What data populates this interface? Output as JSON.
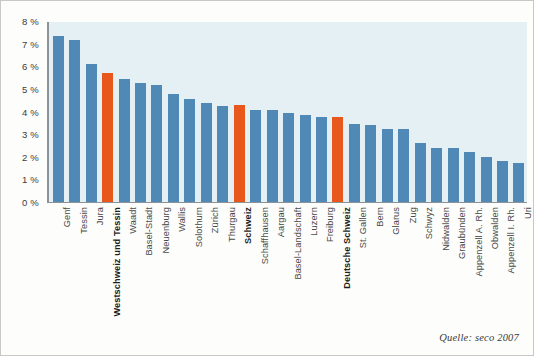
{
  "chart_data": {
    "type": "bar",
    "title": "",
    "subtitle": "",
    "xlabel": "",
    "ylabel": "",
    "ylim": [
      0,
      8
    ],
    "grid": false,
    "legend": "none",
    "source_note": "Quelle: seco 2007",
    "value_suffix": "%",
    "yticks": [
      "0 %",
      "1 %",
      "2 %",
      "3 %",
      "4 %",
      "5 %",
      "6 %",
      "7 %",
      "8 %"
    ],
    "ytick_values": [
      0,
      1,
      2,
      3,
      4,
      5,
      6,
      7,
      8
    ],
    "colors": {
      "bar_default": "#5089b5",
      "bar_highlight": "#e8581c",
      "plot_background": "#e4f0f3",
      "page_background": "#fdfdfb",
      "axis_line": "#8d9296",
      "frame_border": "#c9c9c4",
      "tick_text": "#3b3b3b",
      "label_text": "#4a4a4a"
    },
    "categories": [
      "Genf",
      "Tessin",
      "Jura",
      "Westschweiz und Tessin",
      "Waadt",
      "Basel-Stadt",
      "Neuenburg",
      "Wallis",
      "Solothurn",
      "Zürich",
      "Thurgau",
      "Schweiz",
      "Schaffhausen",
      "Aargau",
      "Basel-Landschaft",
      "Luzern",
      "Freiburg",
      "Deutsche Schweiz",
      "St. Gallen",
      "Bern",
      "Glarus",
      "Zug",
      "Schwyz",
      "Nidwalden",
      "Graubünden",
      "Appenzell A. Rh.",
      "Obwalden",
      "Appenzell I. Rh.",
      "Uri"
    ],
    "values": [
      7.4,
      7.2,
      6.15,
      5.75,
      5.5,
      5.3,
      5.2,
      4.8,
      4.6,
      4.4,
      4.3,
      4.35,
      4.1,
      4.1,
      4.0,
      3.9,
      3.8,
      3.8,
      3.5,
      3.45,
      3.25,
      3.25,
      2.65,
      2.45,
      2.45,
      2.25,
      2.05,
      1.85,
      1.75
    ],
    "highlighted": [
      false,
      false,
      false,
      true,
      false,
      false,
      false,
      false,
      false,
      false,
      false,
      true,
      false,
      false,
      false,
      false,
      false,
      true,
      false,
      false,
      false,
      false,
      false,
      false,
      false,
      false,
      false,
      false,
      false
    ],
    "bold_labels": [
      false,
      false,
      false,
      true,
      false,
      false,
      false,
      false,
      false,
      false,
      false,
      true,
      false,
      false,
      false,
      false,
      false,
      true,
      false,
      false,
      false,
      false,
      false,
      false,
      false,
      false,
      false,
      false,
      false
    ]
  }
}
